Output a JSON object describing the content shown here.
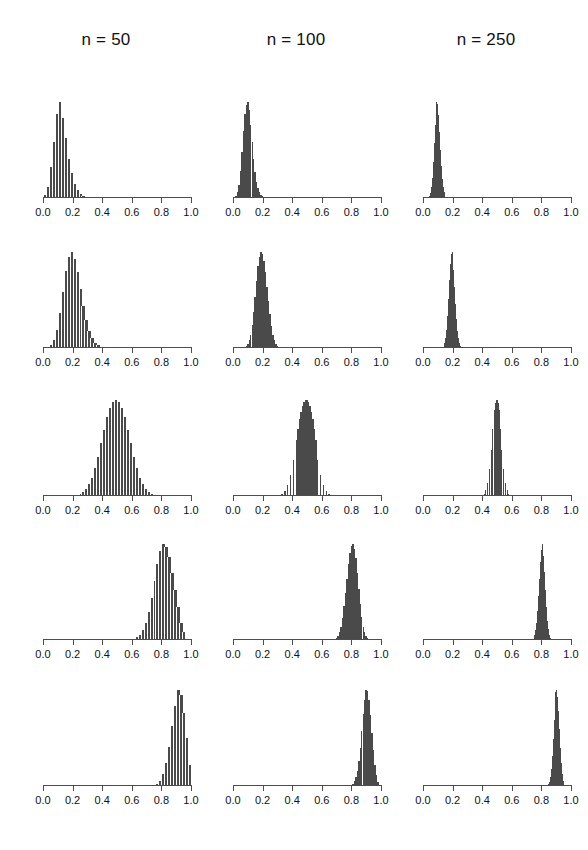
{
  "figure": {
    "title": "",
    "columns": [
      {
        "key": "n50",
        "label": "n = 50",
        "n": 50
      },
      {
        "key": "n100",
        "label": "n = 100",
        "n": 100
      },
      {
        "key": "n250",
        "label": "n = 250",
        "n": 250
      }
    ],
    "axis": {
      "xlim": [
        0.0,
        1.0
      ],
      "tick_values": [
        0.0,
        0.2,
        0.4,
        0.6,
        0.8,
        1.0
      ],
      "tick_labels": [
        "0.0",
        "0.2",
        "0.4",
        "0.6",
        "0.8",
        "1.0"
      ],
      "y_axis_shown": false,
      "grid": false
    },
    "style": {
      "bar_color": "#4a4a4a",
      "axis_color": "#4d4d4d",
      "background": "#ffffff",
      "text_color": "#111111"
    }
  },
  "chart_data": {
    "type": "bar",
    "title": "",
    "subtitle": "",
    "xlabel": "",
    "ylabel": "",
    "xlim": [
      0.0,
      1.0
    ],
    "grid": false,
    "legend_position": "none",
    "row_parameters": [
      0.1,
      0.2,
      0.5,
      0.8,
      0.9
    ],
    "column_sample_sizes": [
      50,
      100,
      250
    ],
    "panels": [
      {
        "row": 0,
        "col": 0,
        "column_label": "n = 50",
        "p": 0.1,
        "n": 50,
        "peak_x": 0.1,
        "spread_sd": 0.042,
        "skew": "right",
        "bin_width": 0.02,
        "bin_centers": [
          0.01,
          0.03,
          0.05,
          0.07,
          0.09,
          0.11,
          0.13,
          0.15,
          0.17,
          0.19,
          0.21,
          0.23,
          0.25,
          0.27,
          0.29
        ],
        "values": [
          3,
          11,
          32,
          58,
          88,
          100,
          83,
          62,
          41,
          26,
          15,
          8,
          4,
          2,
          1
        ]
      },
      {
        "row": 0,
        "col": 1,
        "column_label": "n = 100",
        "p": 0.1,
        "n": 100,
        "peak_x": 0.1,
        "spread_sd": 0.03,
        "skew": "right",
        "bin_width": 0.01,
        "bin_centers": [
          0.02,
          0.03,
          0.04,
          0.05,
          0.06,
          0.07,
          0.08,
          0.09,
          0.1,
          0.11,
          0.12,
          0.13,
          0.14,
          0.15,
          0.16,
          0.17,
          0.18,
          0.19,
          0.2,
          0.21
        ],
        "values": [
          2,
          6,
          14,
          28,
          48,
          70,
          88,
          97,
          100,
          92,
          76,
          58,
          41,
          27,
          17,
          10,
          6,
          3,
          2,
          1
        ]
      },
      {
        "row": 0,
        "col": 2,
        "column_label": "n = 250",
        "p": 0.1,
        "n": 250,
        "peak_x": 0.1,
        "spread_sd": 0.019,
        "skew": "slight-right",
        "bin_width": 0.006,
        "bin_centers": [
          0.046,
          0.052,
          0.058,
          0.064,
          0.07,
          0.076,
          0.082,
          0.088,
          0.094,
          0.1,
          0.106,
          0.112,
          0.118,
          0.124,
          0.13,
          0.136,
          0.142,
          0.148,
          0.154
        ],
        "values": [
          2,
          5,
          11,
          21,
          37,
          57,
          76,
          92,
          100,
          98,
          86,
          69,
          50,
          33,
          20,
          11,
          6,
          3,
          1
        ]
      },
      {
        "row": 1,
        "col": 0,
        "column_label": "n = 50",
        "p": 0.2,
        "n": 50,
        "peak_x": 0.19,
        "spread_sd": 0.057,
        "skew": "right",
        "bin_width": 0.02,
        "bin_centers": [
          0.05,
          0.07,
          0.09,
          0.11,
          0.13,
          0.15,
          0.17,
          0.19,
          0.21,
          0.23,
          0.25,
          0.27,
          0.29,
          0.31,
          0.33,
          0.35,
          0.37,
          0.39
        ],
        "values": [
          3,
          8,
          19,
          36,
          58,
          80,
          95,
          100,
          93,
          79,
          61,
          44,
          29,
          18,
          10,
          5,
          3,
          1
        ]
      },
      {
        "row": 1,
        "col": 1,
        "column_label": "n = 100",
        "p": 0.2,
        "n": 100,
        "peak_x": 0.2,
        "spread_sd": 0.04,
        "skew": "slight-right",
        "bin_width": 0.01,
        "bin_centers": [
          0.09,
          0.1,
          0.11,
          0.12,
          0.13,
          0.14,
          0.15,
          0.16,
          0.17,
          0.18,
          0.19,
          0.2,
          0.21,
          0.22,
          0.23,
          0.24,
          0.25,
          0.26,
          0.27,
          0.28,
          0.29,
          0.3,
          0.31
        ],
        "values": [
          2,
          4,
          8,
          14,
          24,
          37,
          53,
          70,
          85,
          95,
          100,
          98,
          91,
          79,
          64,
          49,
          35,
          23,
          14,
          8,
          4,
          2,
          1
        ]
      },
      {
        "row": 1,
        "col": 2,
        "column_label": "n = 250",
        "p": 0.2,
        "n": 250,
        "peak_x": 0.2,
        "spread_sd": 0.025,
        "skew": "symmetric",
        "bin_width": 0.006,
        "bin_centers": [
          0.142,
          0.148,
          0.154,
          0.16,
          0.166,
          0.172,
          0.178,
          0.184,
          0.19,
          0.196,
          0.202,
          0.208,
          0.214,
          0.22,
          0.226,
          0.232,
          0.238,
          0.244,
          0.25
        ],
        "values": [
          2,
          5,
          10,
          19,
          33,
          51,
          71,
          88,
          98,
          100,
          94,
          81,
          64,
          46,
          30,
          18,
          10,
          5,
          2
        ]
      },
      {
        "row": 2,
        "col": 0,
        "column_label": "n = 50",
        "p": 0.5,
        "n": 50,
        "peak_x": 0.5,
        "spread_sd": 0.071,
        "skew": "symmetric",
        "bin_width": 0.02,
        "bin_centers": [
          0.23,
          0.25,
          0.27,
          0.29,
          0.31,
          0.33,
          0.35,
          0.37,
          0.39,
          0.41,
          0.43,
          0.45,
          0.47,
          0.49,
          0.51,
          0.53,
          0.55,
          0.57,
          0.59,
          0.61,
          0.63,
          0.65,
          0.67,
          0.69,
          0.71,
          0.73,
          0.75
        ],
        "values": [
          1,
          2,
          4,
          7,
          12,
          19,
          29,
          41,
          55,
          69,
          82,
          92,
          98,
          100,
          98,
          92,
          82,
          69,
          55,
          41,
          29,
          19,
          12,
          7,
          4,
          2,
          1
        ]
      },
      {
        "row": 2,
        "col": 1,
        "column_label": "n = 100",
        "p": 0.5,
        "n": 100,
        "peak_x": 0.5,
        "spread_sd": 0.05,
        "skew": "symmetric",
        "bin_width": 0.01,
        "bin_centers": [
          0.33,
          0.35,
          0.37,
          0.39,
          0.41,
          0.43,
          0.44,
          0.45,
          0.46,
          0.47,
          0.48,
          0.49,
          0.5,
          0.51,
          0.52,
          0.53,
          0.54,
          0.55,
          0.56,
          0.57,
          0.59,
          0.61,
          0.63,
          0.65,
          0.67
        ],
        "values": [
          2,
          5,
          11,
          22,
          38,
          58,
          70,
          80,
          88,
          94,
          98,
          100,
          100,
          98,
          94,
          88,
          80,
          70,
          58,
          38,
          22,
          11,
          5,
          2,
          1
        ]
      },
      {
        "row": 2,
        "col": 2,
        "column_label": "n = 250",
        "p": 0.5,
        "n": 250,
        "peak_x": 0.5,
        "spread_sd": 0.032,
        "skew": "symmetric",
        "bin_width": 0.006,
        "bin_centers": [
          0.412,
          0.424,
          0.436,
          0.448,
          0.46,
          0.472,
          0.484,
          0.49,
          0.496,
          0.502,
          0.508,
          0.514,
          0.52,
          0.532,
          0.544,
          0.556,
          0.568,
          0.58,
          0.592
        ],
        "values": [
          2,
          6,
          14,
          28,
          48,
          70,
          90,
          97,
          100,
          100,
          97,
          90,
          70,
          48,
          28,
          14,
          6,
          2,
          1
        ]
      },
      {
        "row": 3,
        "col": 0,
        "column_label": "n = 50",
        "p": 0.8,
        "n": 50,
        "peak_x": 0.81,
        "spread_sd": 0.057,
        "skew": "left",
        "bin_width": 0.02,
        "bin_centers": [
          0.61,
          0.63,
          0.65,
          0.67,
          0.69,
          0.71,
          0.73,
          0.75,
          0.77,
          0.79,
          0.81,
          0.83,
          0.85,
          0.87,
          0.89,
          0.91,
          0.93,
          0.95
        ],
        "values": [
          1,
          3,
          5,
          10,
          18,
          29,
          44,
          61,
          79,
          93,
          100,
          97,
          86,
          70,
          52,
          34,
          18,
          8
        ]
      },
      {
        "row": 3,
        "col": 1,
        "column_label": "n = 100",
        "p": 0.8,
        "n": 100,
        "peak_x": 0.8,
        "spread_sd": 0.04,
        "skew": "left",
        "bin_width": 0.01,
        "bin_centers": [
          0.69,
          0.7,
          0.71,
          0.72,
          0.73,
          0.74,
          0.75,
          0.76,
          0.77,
          0.78,
          0.79,
          0.8,
          0.81,
          0.82,
          0.83,
          0.84,
          0.85,
          0.86,
          0.87,
          0.88,
          0.89,
          0.9,
          0.91
        ],
        "values": [
          1,
          2,
          4,
          8,
          14,
          23,
          35,
          49,
          64,
          79,
          91,
          98,
          100,
          95,
          85,
          70,
          53,
          37,
          24,
          14,
          8,
          4,
          2
        ]
      },
      {
        "row": 3,
        "col": 2,
        "column_label": "n = 250",
        "p": 0.8,
        "n": 250,
        "peak_x": 0.8,
        "spread_sd": 0.025,
        "skew": "slight-left",
        "bin_width": 0.006,
        "bin_centers": [
          0.75,
          0.756,
          0.762,
          0.768,
          0.774,
          0.78,
          0.786,
          0.792,
          0.798,
          0.804,
          0.81,
          0.816,
          0.822,
          0.828,
          0.834,
          0.84,
          0.846,
          0.852,
          0.858
        ],
        "values": [
          2,
          5,
          10,
          18,
          30,
          46,
          64,
          81,
          94,
          100,
          98,
          88,
          71,
          52,
          34,
          20,
          11,
          5,
          2
        ]
      },
      {
        "row": 4,
        "col": 0,
        "column_label": "n = 50",
        "p": 0.9,
        "n": 50,
        "peak_x": 0.91,
        "spread_sd": 0.042,
        "skew": "left",
        "bin_width": 0.02,
        "bin_centers": [
          0.77,
          0.79,
          0.81,
          0.83,
          0.85,
          0.87,
          0.89,
          0.91,
          0.93,
          0.95,
          0.97,
          0.99
        ],
        "values": [
          2,
          5,
          12,
          24,
          41,
          62,
          83,
          100,
          95,
          76,
          50,
          22
        ]
      },
      {
        "row": 4,
        "col": 1,
        "column_label": "n = 100",
        "p": 0.9,
        "n": 100,
        "peak_x": 0.9,
        "spread_sd": 0.03,
        "skew": "left",
        "bin_width": 0.01,
        "bin_centers": [
          0.8,
          0.81,
          0.82,
          0.83,
          0.84,
          0.85,
          0.86,
          0.87,
          0.88,
          0.89,
          0.9,
          0.91,
          0.92,
          0.93,
          0.94,
          0.95,
          0.96,
          0.97,
          0.98
        ],
        "values": [
          1,
          2,
          5,
          9,
          16,
          26,
          40,
          57,
          75,
          90,
          100,
          99,
          90,
          74,
          55,
          37,
          22,
          11,
          4
        ]
      },
      {
        "row": 4,
        "col": 2,
        "column_label": "n = 250",
        "p": 0.9,
        "n": 250,
        "peak_x": 0.9,
        "spread_sd": 0.019,
        "skew": "slight-left",
        "bin_width": 0.006,
        "bin_centers": [
          0.85,
          0.856,
          0.862,
          0.868,
          0.874,
          0.88,
          0.886,
          0.892,
          0.898,
          0.904,
          0.91,
          0.916,
          0.922,
          0.928,
          0.934,
          0.94,
          0.946
        ],
        "values": [
          2,
          4,
          9,
          18,
          31,
          49,
          69,
          87,
          98,
          100,
          93,
          78,
          59,
          40,
          24,
          12,
          5
        ]
      }
    ]
  }
}
